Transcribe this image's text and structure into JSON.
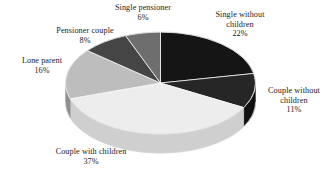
{
  "chart_data": {
    "type": "pie",
    "title": "",
    "subtitle": "",
    "xlabel": "",
    "ylabel": "",
    "legend_position": "none",
    "grid": false,
    "three_d": true,
    "units": "%",
    "categories": [
      "Single without children",
      "Couple without children",
      "Couple with children",
      "Lone parent",
      "Pensioner couple",
      "Single pensioner"
    ],
    "values": [
      22,
      11,
      37,
      16,
      8,
      6
    ],
    "slices": [
      {
        "label": "Single without children",
        "label_line1": "Single without",
        "label_line2": "children",
        "value": 22,
        "value_text": "22%",
        "color": "#151515",
        "side_color": "#070707"
      },
      {
        "label": "Couple without children",
        "label_line1": "Couple without",
        "label_line2": "children",
        "value": 11,
        "value_text": "11%",
        "color": "#262626",
        "side_color": "#111111"
      },
      {
        "label": "Couple with children",
        "label_line1": "Couple with children",
        "label_line2": "",
        "value": 37,
        "value_text": "37%",
        "color": "#ededed",
        "side_color": "#cfcfcf"
      },
      {
        "label": "Lone parent",
        "label_line1": "Lone parent",
        "label_line2": "",
        "value": 16,
        "value_text": "16%",
        "color": "#bdbdbd",
        "side_color": "#8f8f8f"
      },
      {
        "label": "Pensioner couple",
        "label_line1": "Pensioner couple",
        "label_line2": "",
        "value": 8,
        "value_text": "8%",
        "color": "#454545",
        "side_color": "#2b2b2b"
      },
      {
        "label": "Single pensioner",
        "label_line1": "Single pensioner",
        "label_line2": "",
        "value": 6,
        "value_text": "6%",
        "color": "#6e6e6e",
        "side_color": "#4a4a4a"
      }
    ],
    "background_color": "#ffffff",
    "text_color": "#1c1c1c"
  }
}
